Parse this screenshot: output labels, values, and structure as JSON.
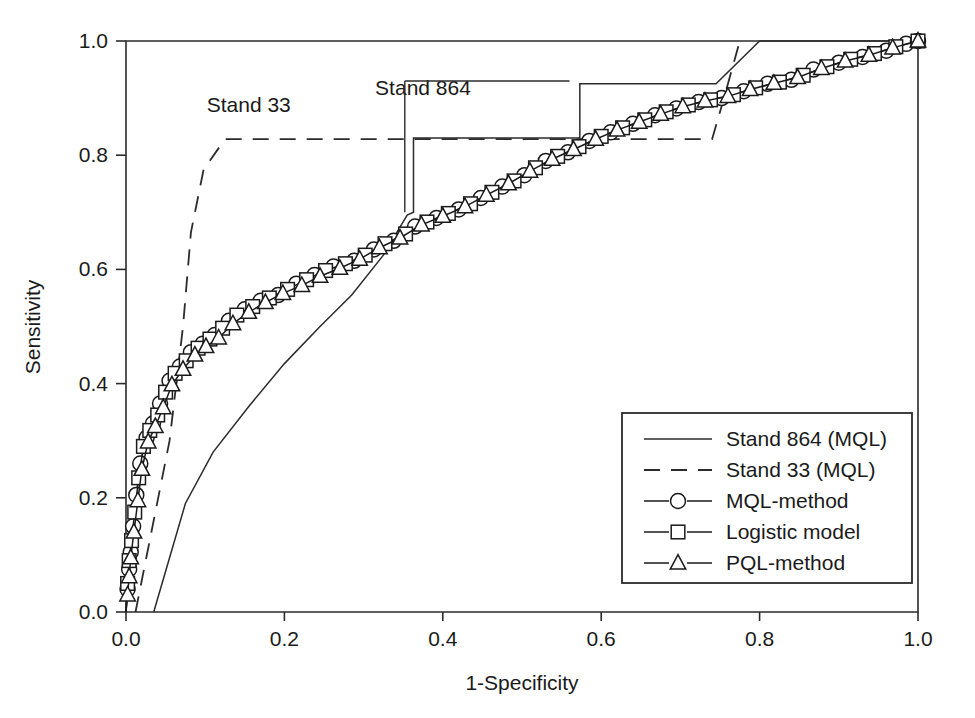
{
  "chart_data": {
    "type": "line",
    "title": "",
    "xlabel": "1-Specificity",
    "ylabel": "Sensitivity",
    "xlim": [
      0.0,
      1.0
    ],
    "ylim": [
      0.0,
      1.0
    ],
    "xticks": [
      "0.0",
      "0.2",
      "0.4",
      "0.6",
      "0.8",
      "1.0"
    ],
    "yticks": [
      "0.0",
      "0.2",
      "0.4",
      "0.6",
      "0.8",
      "1.0"
    ],
    "xtickvalues": [
      0.0,
      0.2,
      0.4,
      0.6,
      0.8,
      1.0
    ],
    "ytickvalues": [
      0.0,
      0.2,
      0.4,
      0.6,
      0.8,
      1.0
    ],
    "grid": false,
    "legend_position": "lower-right",
    "annotations": [
      {
        "text": "Stand 33",
        "x": 0.155,
        "y": 0.875
      },
      {
        "text": "Stand 864",
        "x": 0.375,
        "y": 0.905
      }
    ],
    "series": [
      {
        "name": "Stand 864 (MQL)",
        "style": "solid-step",
        "marker": "none",
        "points": [
          [
            0.035,
            0.0
          ],
          [
            0.075,
            0.19
          ],
          [
            0.11,
            0.28
          ],
          [
            0.155,
            0.36
          ],
          [
            0.2,
            0.435
          ],
          [
            0.245,
            0.5
          ],
          [
            0.285,
            0.555
          ],
          [
            0.325,
            0.625
          ],
          [
            0.355,
            0.695
          ],
          [
            0.363,
            0.7
          ],
          [
            0.363,
            0.83
          ],
          [
            0.573,
            0.83
          ],
          [
            0.573,
            0.925
          ],
          [
            0.745,
            0.925
          ],
          [
            0.8,
            1.0
          ],
          [
            1.0,
            1.0
          ]
        ]
      },
      {
        "name": "Stand 33 (MQL)",
        "style": "dashed",
        "marker": "none",
        "points": [
          [
            0.012,
            0.0
          ],
          [
            0.055,
            0.3
          ],
          [
            0.072,
            0.5
          ],
          [
            0.082,
            0.665
          ],
          [
            0.098,
            0.775
          ],
          [
            0.125,
            0.828
          ],
          [
            0.74,
            0.828
          ],
          [
            0.755,
            0.9
          ],
          [
            0.775,
            1.0
          ]
        ]
      },
      {
        "name": "MQL-method",
        "style": "solid",
        "marker": "circle",
        "points": [
          [
            0.0,
            0.0
          ],
          [
            0.002,
            0.04
          ],
          [
            0.004,
            0.075
          ],
          [
            0.006,
            0.105
          ],
          [
            0.009,
            0.15
          ],
          [
            0.013,
            0.205
          ],
          [
            0.018,
            0.26
          ],
          [
            0.026,
            0.305
          ],
          [
            0.034,
            0.33
          ],
          [
            0.043,
            0.365
          ],
          [
            0.055,
            0.405
          ],
          [
            0.068,
            0.43
          ],
          [
            0.082,
            0.455
          ],
          [
            0.097,
            0.47
          ],
          [
            0.112,
            0.485
          ],
          [
            0.13,
            0.51
          ],
          [
            0.15,
            0.53
          ],
          [
            0.17,
            0.545
          ],
          [
            0.192,
            0.555
          ],
          [
            0.215,
            0.575
          ],
          [
            0.238,
            0.59
          ],
          [
            0.262,
            0.605
          ],
          [
            0.288,
            0.615
          ],
          [
            0.313,
            0.635
          ],
          [
            0.338,
            0.65
          ],
          [
            0.365,
            0.675
          ],
          [
            0.392,
            0.69
          ],
          [
            0.42,
            0.705
          ],
          [
            0.448,
            0.725
          ],
          [
            0.475,
            0.745
          ],
          [
            0.503,
            0.765
          ],
          [
            0.53,
            0.79
          ],
          [
            0.558,
            0.805
          ],
          [
            0.585,
            0.825
          ],
          [
            0.612,
            0.84
          ],
          [
            0.64,
            0.855
          ],
          [
            0.668,
            0.87
          ],
          [
            0.695,
            0.882
          ],
          [
            0.723,
            0.893
          ],
          [
            0.752,
            0.9
          ],
          [
            0.78,
            0.912
          ],
          [
            0.81,
            0.925
          ],
          [
            0.84,
            0.932
          ],
          [
            0.868,
            0.95
          ],
          [
            0.9,
            0.962
          ],
          [
            0.93,
            0.972
          ],
          [
            0.96,
            0.983
          ],
          [
            0.985,
            0.995
          ],
          [
            1.0,
            1.0
          ]
        ]
      },
      {
        "name": "Logistic model",
        "style": "solid",
        "marker": "square",
        "points": [
          [
            0.0,
            0.0
          ],
          [
            0.002,
            0.05
          ],
          [
            0.004,
            0.09
          ],
          [
            0.007,
            0.125
          ],
          [
            0.011,
            0.175
          ],
          [
            0.016,
            0.235
          ],
          [
            0.022,
            0.29
          ],
          [
            0.03,
            0.318
          ],
          [
            0.04,
            0.345
          ],
          [
            0.05,
            0.385
          ],
          [
            0.062,
            0.418
          ],
          [
            0.076,
            0.44
          ],
          [
            0.091,
            0.462
          ],
          [
            0.106,
            0.478
          ],
          [
            0.122,
            0.497
          ],
          [
            0.14,
            0.52
          ],
          [
            0.16,
            0.535
          ],
          [
            0.181,
            0.55
          ],
          [
            0.204,
            0.565
          ],
          [
            0.228,
            0.582
          ],
          [
            0.252,
            0.598
          ],
          [
            0.277,
            0.61
          ],
          [
            0.302,
            0.625
          ],
          [
            0.327,
            0.645
          ],
          [
            0.353,
            0.662
          ],
          [
            0.38,
            0.683
          ],
          [
            0.407,
            0.698
          ],
          [
            0.435,
            0.715
          ],
          [
            0.462,
            0.735
          ],
          [
            0.49,
            0.755
          ],
          [
            0.517,
            0.778
          ],
          [
            0.545,
            0.798
          ],
          [
            0.572,
            0.815
          ],
          [
            0.6,
            0.833
          ],
          [
            0.627,
            0.848
          ],
          [
            0.655,
            0.862
          ],
          [
            0.682,
            0.876
          ],
          [
            0.71,
            0.888
          ],
          [
            0.738,
            0.897
          ],
          [
            0.767,
            0.906
          ],
          [
            0.795,
            0.918
          ],
          [
            0.825,
            0.928
          ],
          [
            0.855,
            0.94
          ],
          [
            0.885,
            0.955
          ],
          [
            0.915,
            0.968
          ],
          [
            0.945,
            0.978
          ],
          [
            0.972,
            0.99
          ],
          [
            1.0,
            1.0
          ]
        ]
      },
      {
        "name": "PQL-method",
        "style": "solid",
        "marker": "triangle",
        "points": [
          [
            0.0,
            0.0
          ],
          [
            0.002,
            0.03
          ],
          [
            0.004,
            0.062
          ],
          [
            0.006,
            0.095
          ],
          [
            0.01,
            0.14
          ],
          [
            0.015,
            0.195
          ],
          [
            0.02,
            0.25
          ],
          [
            0.028,
            0.298
          ],
          [
            0.037,
            0.325
          ],
          [
            0.047,
            0.358
          ],
          [
            0.058,
            0.398
          ],
          [
            0.072,
            0.425
          ],
          [
            0.087,
            0.45
          ],
          [
            0.101,
            0.465
          ],
          [
            0.117,
            0.48
          ],
          [
            0.135,
            0.505
          ],
          [
            0.155,
            0.525
          ],
          [
            0.176,
            0.542
          ],
          [
            0.198,
            0.558
          ],
          [
            0.222,
            0.572
          ],
          [
            0.245,
            0.588
          ],
          [
            0.27,
            0.602
          ],
          [
            0.295,
            0.618
          ],
          [
            0.32,
            0.638
          ],
          [
            0.346,
            0.655
          ],
          [
            0.373,
            0.678
          ],
          [
            0.4,
            0.693
          ],
          [
            0.428,
            0.71
          ],
          [
            0.455,
            0.73
          ],
          [
            0.483,
            0.75
          ],
          [
            0.51,
            0.772
          ],
          [
            0.538,
            0.793
          ],
          [
            0.565,
            0.81
          ],
          [
            0.593,
            0.828
          ],
          [
            0.62,
            0.844
          ],
          [
            0.648,
            0.858
          ],
          [
            0.675,
            0.872
          ],
          [
            0.703,
            0.885
          ],
          [
            0.731,
            0.895
          ],
          [
            0.76,
            0.903
          ],
          [
            0.788,
            0.915
          ],
          [
            0.818,
            0.926
          ],
          [
            0.848,
            0.936
          ],
          [
            0.878,
            0.952
          ],
          [
            0.908,
            0.965
          ],
          [
            0.938,
            0.975
          ],
          [
            0.968,
            0.988
          ],
          [
            1.0,
            1.0
          ]
        ]
      }
    ]
  },
  "legend": {
    "items": [
      {
        "label": "Stand 864 (MQL)",
        "style": "solid",
        "marker": "none"
      },
      {
        "label": "Stand 33 (MQL)",
        "style": "dashed",
        "marker": "none"
      },
      {
        "label": "MQL-method",
        "style": "solid",
        "marker": "circle"
      },
      {
        "label": "Logistic model",
        "style": "solid",
        "marker": "square"
      },
      {
        "label": "PQL-method",
        "style": "solid",
        "marker": "triangle"
      }
    ]
  },
  "colors": {
    "axis": "#2b2b2b",
    "line": "#1a1a1a",
    "background": "#ffffff",
    "marker_fill": "#ffffff"
  }
}
